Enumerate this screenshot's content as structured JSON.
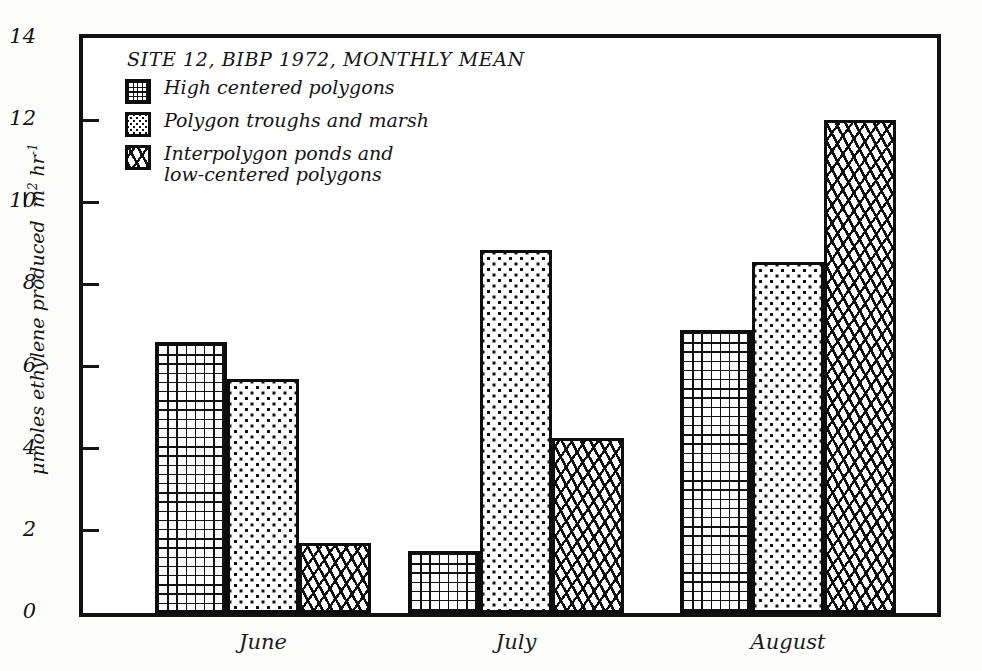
{
  "chart_data": {
    "type": "bar",
    "title": "SITE 12, BIBP 1972, MONTHLY MEAN",
    "xlabel": "",
    "ylabel": "μ moles ethylene produced m¯² hr⁻¹",
    "ylabel_main": "μmoles ethylene produced",
    "ylabel_unit_m": "m",
    "ylabel_unit_m_exp": "2",
    "ylabel_unit_hr": "hr",
    "ylabel_unit_hr_exp": "-1",
    "categories": [
      "June",
      "July",
      "August"
    ],
    "series": [
      {
        "name": "High centered polygons",
        "pattern": "grid",
        "values": [
          6.6,
          1.5,
          6.9
        ]
      },
      {
        "name": "Polygon troughs and marsh",
        "pattern": "dots",
        "values": [
          5.7,
          8.85,
          8.55
        ]
      },
      {
        "name": "Interpolygon ponds and\nlow-centered polygons",
        "pattern": "speckle",
        "values": [
          1.7,
          4.25,
          12.0
        ]
      }
    ],
    "ylim": [
      0,
      14
    ],
    "yticks": [
      0,
      2,
      4,
      6,
      8,
      10,
      12,
      14
    ],
    "ytick_labels": [
      "0",
      "2",
      "4",
      "6",
      "8",
      "10",
      "12",
      "14"
    ],
    "grid": false,
    "legend_position": "upper-left",
    "colors": {
      "ink": "#111111",
      "background": "#ffffff"
    }
  },
  "legend": {
    "title": "SITE 12, BIBP 1972, MONTHLY MEAN",
    "entries": [
      {
        "label": "High centered polygons",
        "pattern": "grid"
      },
      {
        "label": "Polygon troughs and marsh",
        "pattern": "dots"
      },
      {
        "label": "Interpolygon ponds and\nlow-centered polygons",
        "pattern": "speckle"
      }
    ]
  }
}
